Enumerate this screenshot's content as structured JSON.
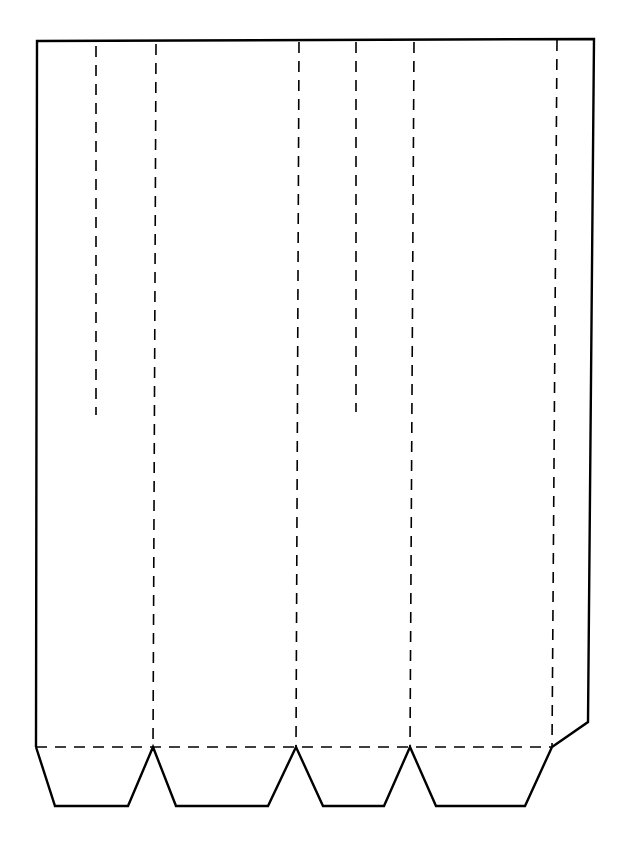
{
  "diagram": {
    "type": "box-template-net",
    "cut_line_color": "#000000",
    "fold_line_color": "#000000",
    "background": "#ffffff",
    "panels": 4,
    "bottom_tabs": 4,
    "side_glue_tab": 1,
    "short_slits": 2
  }
}
